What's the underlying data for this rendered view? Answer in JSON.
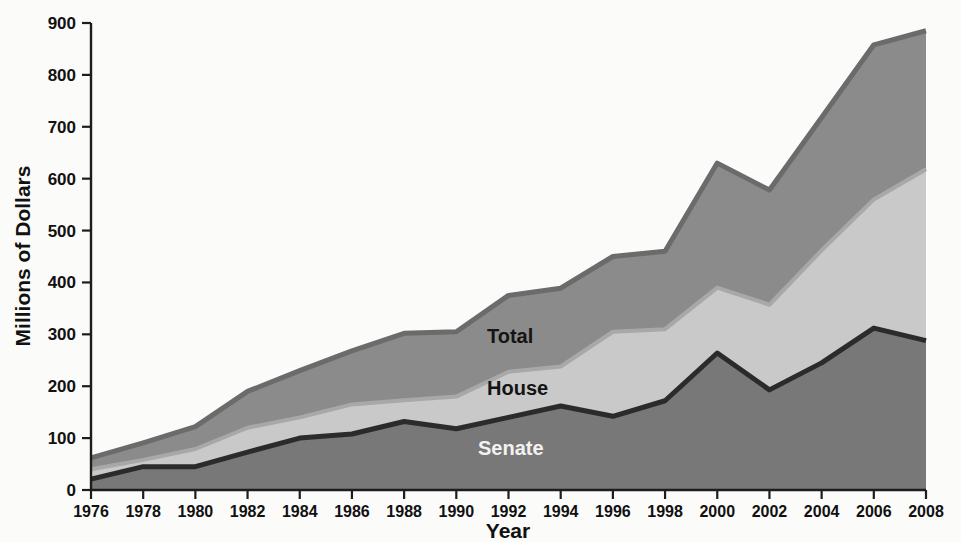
{
  "chart_data": {
    "type": "area",
    "title": "",
    "xlabel": "Year",
    "ylabel": "Millions of Dollars",
    "x": [
      1976,
      1978,
      1980,
      1982,
      1984,
      1986,
      1988,
      1990,
      1992,
      1994,
      1996,
      1998,
      2000,
      2002,
      2004,
      2006,
      2008
    ],
    "xlim": [
      1976,
      2008
    ],
    "ylim": [
      0,
      900
    ],
    "yticks": [
      0,
      100,
      200,
      300,
      400,
      500,
      600,
      700,
      800,
      900
    ],
    "xticks": [
      "1976",
      "1978",
      "1980",
      "1982",
      "1984",
      "1986",
      "1988",
      "1990",
      "1992",
      "1994",
      "1996",
      "1998",
      "2000",
      "2002",
      "2004",
      "2006",
      "2008"
    ],
    "grid": false,
    "legend_position": "inline-labels",
    "stacked": false,
    "series": [
      {
        "name": "Total",
        "label": "Total",
        "color": "#8b8b8b",
        "values": [
          62,
          91,
          122,
          190,
          230,
          268,
          302,
          305,
          375,
          389,
          450,
          460,
          630,
          578,
          718,
          858,
          885
        ]
      },
      {
        "name": "House",
        "label": "House",
        "color": "#c9c9c9",
        "values": [
          40,
          58,
          79,
          120,
          140,
          165,
          173,
          180,
          228,
          238,
          305,
          310,
          390,
          357,
          462,
          560,
          618
        ]
      },
      {
        "name": "Senate",
        "label": "Senate",
        "color": "#787878",
        "values": [
          21,
          45,
          45,
          73,
          100,
          108,
          132,
          118,
          140,
          162,
          142,
          172,
          264,
          193,
          245,
          312,
          288
        ]
      }
    ]
  },
  "axes": {
    "y_title": "Millions of Dollars",
    "x_title": "Year",
    "y_tick_labels": [
      "0",
      "100",
      "200",
      "300",
      "400",
      "500",
      "600",
      "700",
      "800",
      "900"
    ],
    "x_tick_labels": [
      "1976",
      "1978",
      "1980",
      "1982",
      "1984",
      "1986",
      "1988",
      "1990",
      "1992",
      "1994",
      "1996",
      "1998",
      "2000",
      "2002",
      "2004",
      "2006",
      "2008"
    ]
  },
  "inline_labels": {
    "total": "Total",
    "house": "House",
    "senate": "Senate"
  },
  "colors": {
    "total_band": "#8b8b8b",
    "house_band": "#c9c9c9",
    "senate_band": "#787878",
    "total_line": "#6b6b6b",
    "house_line": "#a8a8a8",
    "senate_line": "#2b2b2b",
    "axis": "#1d1d1d",
    "background": "#fbfbfa"
  }
}
